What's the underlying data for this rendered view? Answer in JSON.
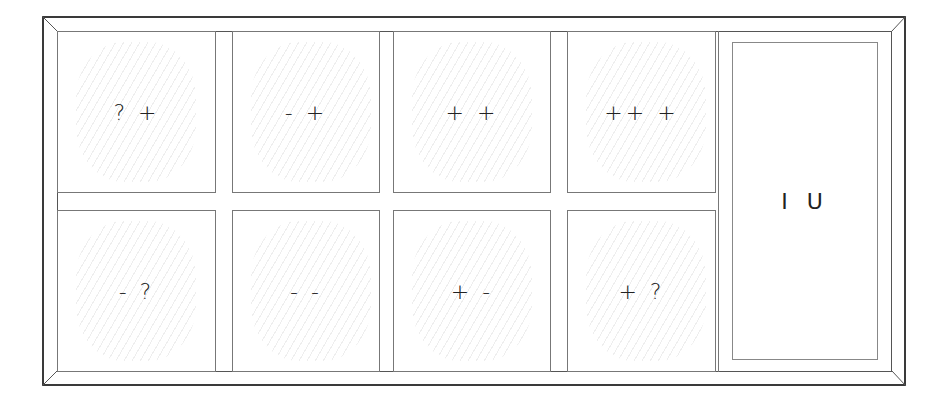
{
  "diagram": {
    "type": "grid-matrix",
    "rows": 2,
    "columns": 4,
    "cells": [
      {
        "row": 1,
        "col": 1,
        "label": "? +"
      },
      {
        "row": 1,
        "col": 2,
        "label": "- +"
      },
      {
        "row": 1,
        "col": 3,
        "label": "+ +"
      },
      {
        "row": 1,
        "col": 4,
        "label": "++ +"
      },
      {
        "row": 2,
        "col": 1,
        "label": "- ?"
      },
      {
        "row": 2,
        "col": 2,
        "label": "- -"
      },
      {
        "row": 2,
        "col": 3,
        "label": "+ -"
      },
      {
        "row": 2,
        "col": 4,
        "label": "+ ?"
      }
    ],
    "side_panel": {
      "label": "I U"
    }
  }
}
